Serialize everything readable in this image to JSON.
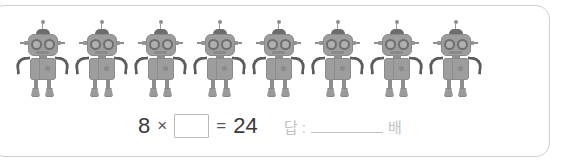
{
  "card": {
    "border_color": "#cfcfcf",
    "background": "#ffffff"
  },
  "illustration": {
    "icon_name": "robot-icon",
    "count": 8,
    "body_color": "#9d9d9d",
    "accent_color": "#5c5c5c",
    "items": [
      {
        "label": "robot 1"
      },
      {
        "label": "robot 2"
      },
      {
        "label": "robot 3"
      },
      {
        "label": "robot 4"
      },
      {
        "label": "robot 5"
      },
      {
        "label": "robot 6"
      },
      {
        "label": "robot 7"
      },
      {
        "label": "robot 8"
      }
    ]
  },
  "equation": {
    "left_operand": "8",
    "operator": "×",
    "blank_value": "",
    "blank_placeholder": "",
    "equals": "=",
    "result": "24"
  },
  "answer": {
    "label": "답 :",
    "value": "",
    "unit": "배"
  }
}
